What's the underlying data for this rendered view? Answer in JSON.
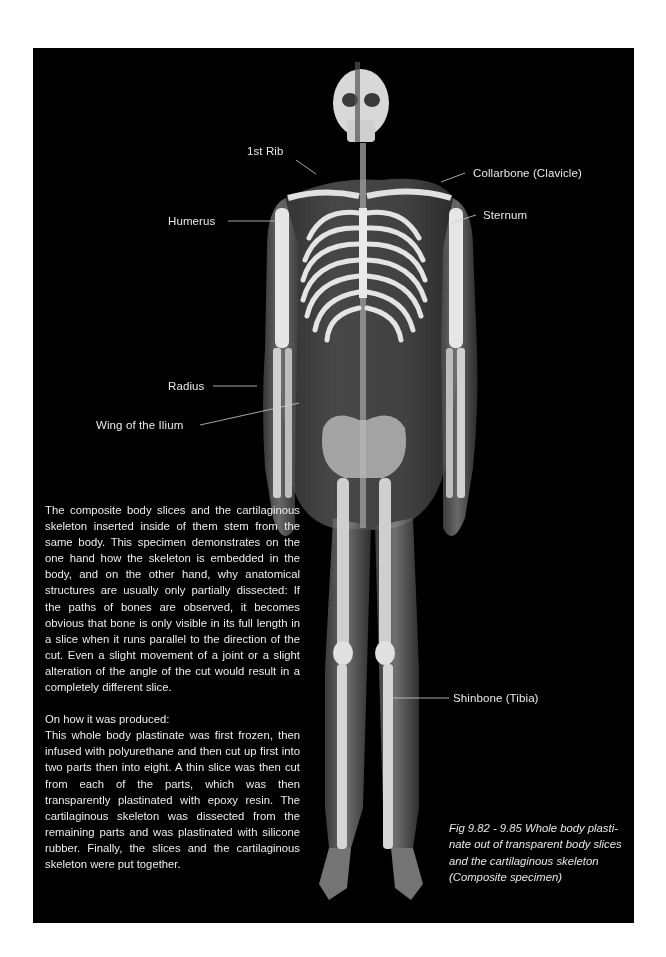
{
  "page": {
    "background": "#ffffff",
    "frame_color": "#000000",
    "text_color": "#ececec"
  },
  "figure": {
    "labels": [
      {
        "id": "1st-rib",
        "text": "1st Rib"
      },
      {
        "id": "collarbone",
        "text": "Collarbone (Clavicle)"
      },
      {
        "id": "humerus",
        "text": "Humerus"
      },
      {
        "id": "sternum",
        "text": "Sternum"
      },
      {
        "id": "radius",
        "text": "Radius"
      },
      {
        "id": "wing-of-ilium",
        "text": "Wing of the Ilium"
      },
      {
        "id": "shinbone",
        "text": "Shinbone (Tibia)"
      }
    ]
  },
  "body_text": {
    "paragraph_1": "The composite body slices and the cartilag­inous skeleton inserted inside of them stem from the same body. This specimen dem­onstrates on the one hand how the skele­ton is embedded in the body, and on the other hand, why anatomical structures are usually only partially dissected: If the paths of bones are observed, it becomes obvious that bone is only visible in its full length in a slice when it runs parallel to the direction of the cut. Even a slight movement of a joint or a slight alteration of the angle of the cut would result in a completely different slice.",
    "heading_2": "On how it was produced:",
    "paragraph_2": "This whole body plastinate was first frozen, then infused with polyurethane and then cut up first into two parts then into eight. A thin slice was then cut from each of the parts, which was then transparently plas­tinated with epoxy resin. The cartilaginous skeleton was dissected from the remaining parts and was plastinated with silicone rub­ber. Finally, the slices and the cartilaginous skeleton were put together."
  },
  "caption": {
    "text": "Fig 9.82 - 9.85 Whole body plasti­nate out of transparent body slices and the cartilaginous skeleton (Composite specimen)"
  }
}
